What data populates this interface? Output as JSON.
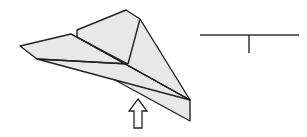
{
  "diagram": {
    "colors": {
      "paper_fill": "#e8e8e8",
      "stroke": "#222222",
      "background": "#ffffff"
    },
    "figures": [
      {
        "name": "paper-airplane",
        "label": "Paper airplane"
      },
      {
        "name": "push-arrow",
        "label": "Upward arrow"
      },
      {
        "name": "cross-section",
        "label": "T-shaped cross-section"
      }
    ]
  }
}
